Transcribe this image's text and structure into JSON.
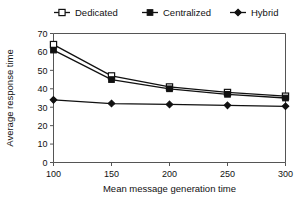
{
  "chart_data": {
    "type": "line",
    "title": "",
    "xlabel": "Mean message generation time",
    "ylabel": "Average response time",
    "x": [
      100,
      150,
      200,
      250,
      300
    ],
    "xticks": [
      "100",
      "150",
      "200",
      "250",
      "300"
    ],
    "yticks": [
      "0",
      "10",
      "20",
      "30",
      "40",
      "50",
      "60",
      "70"
    ],
    "xlim": [
      100,
      300
    ],
    "ylim": [
      0,
      70
    ],
    "grid": false,
    "legend_position": "top",
    "series": [
      {
        "name": "Dedicated",
        "marker": "open-square",
        "color": "#111111",
        "values": [
          64,
          47,
          41,
          38,
          36
        ]
      },
      {
        "name": "Centralized",
        "marker": "filled-square",
        "color": "#111111",
        "values": [
          61,
          45,
          40,
          37,
          35
        ]
      },
      {
        "name": "Hybrid",
        "marker": "filled-diamond",
        "color": "#111111",
        "values": [
          34,
          32,
          31.5,
          31,
          30.5
        ]
      }
    ]
  }
}
